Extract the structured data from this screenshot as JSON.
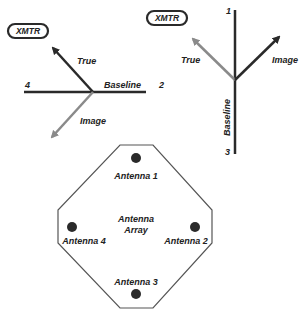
{
  "colors": {
    "dark": "#2a2a2a",
    "gray_arrow": "#8a8a8a",
    "outline": "#555555",
    "text": "#222222"
  },
  "left_diagram": {
    "transmitter": "XMTR",
    "true_label": "True",
    "image_label": "Image",
    "baseline_label": "Baseline",
    "end_left": "4",
    "end_right": "2"
  },
  "right_diagram": {
    "transmitter": "XMTR",
    "true_label": "True",
    "image_label": "Image",
    "baseline_label": "Baseline",
    "end_top": "1",
    "end_bottom": "3"
  },
  "antenna_array": {
    "center_line1": "Antenna",
    "center_line2": "Array",
    "antennas": [
      {
        "label": "Antenna 1"
      },
      {
        "label": "Antenna 2"
      },
      {
        "label": "Antenna 3"
      },
      {
        "label": "Antenna 4"
      }
    ]
  }
}
